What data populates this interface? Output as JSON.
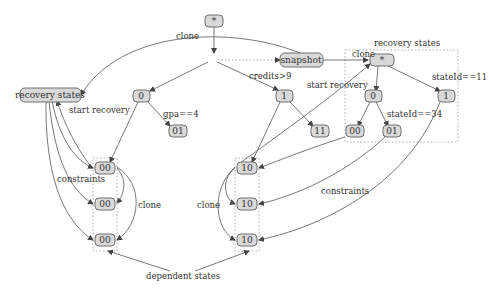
{
  "diagram": {
    "nodes": {
      "root": "*",
      "snapshot": "snapshot",
      "recovery_states_left": "recovery states",
      "n0": "0",
      "n01": "01",
      "n1": "1",
      "n11": "11",
      "r_root": "*",
      "r0": "0",
      "r1": "1",
      "r00": "00",
      "r01": "01",
      "dep_left": [
        "00",
        "00",
        "00"
      ],
      "dep_mid": [
        "10",
        "10",
        "10"
      ]
    },
    "labels": {
      "clone_top": "clone",
      "gpa": "gpa==4",
      "credits": "credits>9",
      "start_recovery_left": "start recovery",
      "start_recovery_right": "start recovery",
      "recovery_states_box": "recovery states",
      "clone_right": "clone",
      "stateid11": "stateId==11",
      "stateid34": "stateId==34",
      "constraints_left": "constraints",
      "clone_left": "clone",
      "clone_mid": "clone",
      "constraints_right": "constraints",
      "dependent_states": "dependent states"
    }
  }
}
